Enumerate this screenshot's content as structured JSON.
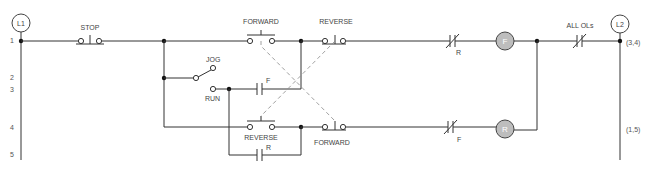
{
  "rails": {
    "left": {
      "label": "L1"
    },
    "right": {
      "label": "L2"
    }
  },
  "line_numbers": [
    "1",
    "2",
    "3",
    "4",
    "5"
  ],
  "contacts": {
    "stop": {
      "label": "STOP",
      "type": "normally-closed pushbutton"
    },
    "jog": {
      "label": "JOG",
      "type": "selector switch"
    },
    "run": {
      "label": "RUN",
      "type": "selector switch position"
    },
    "forward_pb_top": {
      "label": "FORWARD",
      "type": "normally-open pushbutton"
    },
    "reverse_pb_top": {
      "label": "REVERSE",
      "type": "normally-closed pushbutton"
    },
    "reverse_pb_bottom": {
      "label": "REVERSE",
      "type": "normally-open pushbutton"
    },
    "forward_pb_bottom": {
      "label": "FORWARD",
      "type": "normally-closed pushbutton"
    },
    "f_seal": {
      "label": "F",
      "type": "normally-open contact"
    },
    "r_seal": {
      "label": "R",
      "type": "normally-open contact"
    },
    "r_interlock": {
      "label": "R",
      "type": "normally-closed contact"
    },
    "f_interlock": {
      "label": "F",
      "type": "normally-closed contact"
    },
    "overloads": {
      "label": "ALL OLs",
      "type": "normally-closed contact"
    }
  },
  "coils": {
    "forward": {
      "label": "F"
    },
    "reverse": {
      "label": "R"
    }
  },
  "cross_refs": {
    "forward": "(3,4)",
    "reverse": "(1,5)"
  }
}
